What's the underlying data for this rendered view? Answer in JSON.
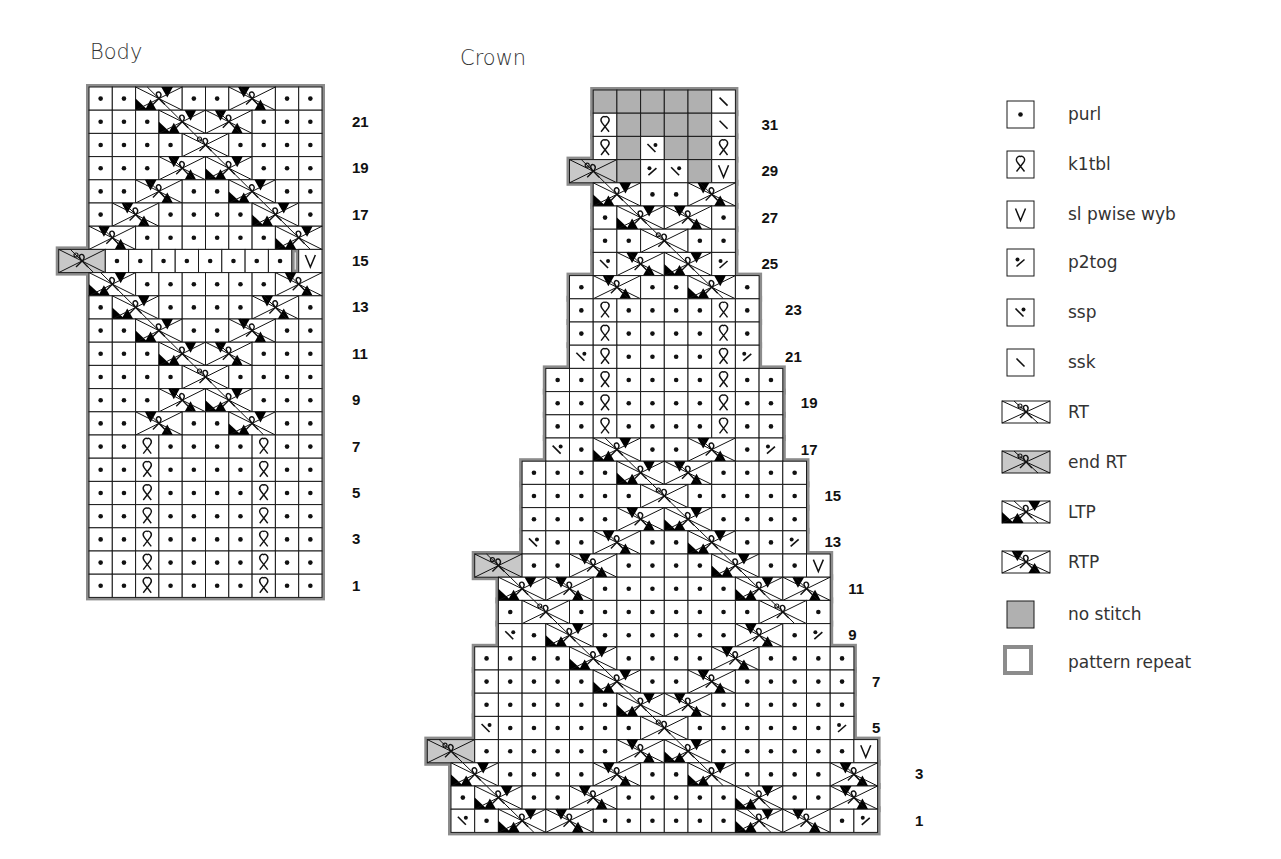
{
  "titles": {
    "body": "Body",
    "crown": "Crown"
  },
  "legend": [
    {
      "code": "p",
      "label": "purl"
    },
    {
      "code": "k",
      "label": "k1tbl"
    },
    {
      "code": "v",
      "label": "sl pwise wyb"
    },
    {
      "code": "p2",
      "label": "p2tog"
    },
    {
      "code": "ss",
      "label": "ssp"
    },
    {
      "code": "sk",
      "label": "ssk"
    },
    {
      "code": "RT",
      "label": "RT"
    },
    {
      "code": "ERT",
      "label": "end RT"
    },
    {
      "code": "LTP",
      "label": "LTP"
    },
    {
      "code": "RTP",
      "label": "RTP"
    },
    {
      "code": "ns",
      "label": "no stitch"
    },
    {
      "code": "rep",
      "label": "pattern repeat"
    }
  ],
  "colors": {
    "grid": "#1a1a1a",
    "repeat_border": "#8c8c8c",
    "no_stitch": "#b0b0b0",
    "end_rt": "#c8c8c8",
    "fill": "#000000"
  },
  "chart_data": [
    {
      "type": "table",
      "title": "Body",
      "columns": 10,
      "row_labels": [
        1,
        3,
        5,
        7,
        9,
        11,
        13,
        15,
        17,
        19,
        21
      ],
      "rows": [
        {
          "row": 22,
          "off": 0,
          "cells": [
            "p",
            "p",
            "LTP",
            "_",
            "p",
            "p",
            "RTP",
            "_",
            "p",
            "p"
          ]
        },
        {
          "row": 21,
          "off": 0,
          "cells": [
            "p",
            "p",
            "p",
            "LTP",
            "_",
            "RTP",
            "_",
            "p",
            "p",
            "p"
          ]
        },
        {
          "row": 20,
          "off": 0,
          "cells": [
            "p",
            "p",
            "p",
            "p",
            "RT",
            "_",
            "p",
            "p",
            "p",
            "p"
          ]
        },
        {
          "row": 19,
          "off": 0,
          "cells": [
            "p",
            "p",
            "p",
            "RTP",
            "_",
            "LTP",
            "_",
            "p",
            "p",
            "p"
          ]
        },
        {
          "row": 18,
          "off": 0,
          "cells": [
            "p",
            "p",
            "RTP",
            "_",
            "p",
            "p",
            "LTP",
            "_",
            "p",
            "p"
          ]
        },
        {
          "row": 17,
          "off": 0,
          "cells": [
            "p",
            "RTP",
            "_",
            "p",
            "p",
            "p",
            "p",
            "LTP",
            "_",
            "p"
          ]
        },
        {
          "row": 16,
          "off": 0,
          "cells": [
            "RTP",
            "_",
            "p",
            "p",
            "p",
            "p",
            "p",
            "p",
            "LTP",
            "_"
          ]
        },
        {
          "row": 15,
          "off": -1.3,
          "cells": [
            "ERT",
            "_",
            "p",
            "p",
            "p",
            "p",
            "p",
            "p",
            "p",
            "p"
          ],
          "extra": [
            {
              "col": 9,
              "code": "v"
            }
          ]
        },
        {
          "row": 14,
          "off": 0,
          "cells": [
            "LTP",
            "_",
            "p",
            "p",
            "p",
            "p",
            "p",
            "p",
            "RTP",
            "_"
          ]
        },
        {
          "row": 13,
          "off": 0,
          "cells": [
            "p",
            "LTP",
            "_",
            "p",
            "p",
            "p",
            "p",
            "RTP",
            "_",
            "p"
          ]
        },
        {
          "row": 12,
          "off": 0,
          "cells": [
            "p",
            "p",
            "LTP",
            "_",
            "p",
            "p",
            "RTP",
            "_",
            "p",
            "p"
          ]
        },
        {
          "row": 11,
          "off": 0,
          "cells": [
            "p",
            "p",
            "p",
            "LTP",
            "_",
            "RTP",
            "_",
            "p",
            "p",
            "p"
          ]
        },
        {
          "row": 10,
          "off": 0,
          "cells": [
            "p",
            "p",
            "p",
            "p",
            "RT",
            "_",
            "p",
            "p",
            "p",
            "p"
          ]
        },
        {
          "row": 9,
          "off": 0,
          "cells": [
            "p",
            "p",
            "p",
            "RTP",
            "_",
            "LTP",
            "_",
            "p",
            "p",
            "p"
          ]
        },
        {
          "row": 8,
          "off": 0,
          "cells": [
            "p",
            "p",
            "RTP",
            "_",
            "p",
            "p",
            "LTP",
            "_",
            "p",
            "p"
          ]
        },
        {
          "row": 7,
          "off": 0,
          "cells": [
            "p",
            "p",
            "k",
            "p",
            "p",
            "p",
            "p",
            "k",
            "p",
            "p"
          ]
        },
        {
          "row": 6,
          "off": 0,
          "cells": [
            "p",
            "p",
            "k",
            "p",
            "p",
            "p",
            "p",
            "k",
            "p",
            "p"
          ]
        },
        {
          "row": 5,
          "off": 0,
          "cells": [
            "p",
            "p",
            "k",
            "p",
            "p",
            "p",
            "p",
            "k",
            "p",
            "p"
          ]
        },
        {
          "row": 4,
          "off": 0,
          "cells": [
            "p",
            "p",
            "k",
            "p",
            "p",
            "p",
            "p",
            "k",
            "p",
            "p"
          ]
        },
        {
          "row": 3,
          "off": 0,
          "cells": [
            "p",
            "p",
            "k",
            "p",
            "p",
            "p",
            "p",
            "k",
            "p",
            "p"
          ]
        },
        {
          "row": 2,
          "off": 0,
          "cells": [
            "p",
            "p",
            "k",
            "p",
            "p",
            "p",
            "p",
            "k",
            "p",
            "p"
          ]
        },
        {
          "row": 1,
          "off": 0,
          "cells": [
            "p",
            "p",
            "k",
            "p",
            "p",
            "p",
            "p",
            "k",
            "p",
            "p"
          ]
        }
      ]
    },
    {
      "type": "table",
      "title": "Crown",
      "columns": 18,
      "row_labels": [
        1,
        3,
        5,
        7,
        9,
        11,
        13,
        15,
        17,
        19,
        21,
        23,
        25,
        27,
        29,
        31
      ],
      "rows": [
        {
          "row": 32,
          "off": 6,
          "cells": [
            "ns",
            "ns",
            "ns",
            "ns",
            "ns",
            "sk"
          ]
        },
        {
          "row": 31,
          "off": 6,
          "cells": [
            "k",
            "ns",
            "ns",
            "ns",
            "ns",
            "sk"
          ]
        },
        {
          "row": 30,
          "off": 6,
          "cells": [
            "k",
            "ns",
            "ss",
            "ns",
            "ns",
            "k"
          ]
        },
        {
          "row": 29,
          "off": 5,
          "cells": [
            "ERT",
            "_",
            "ns",
            "p2",
            "ss",
            "ns",
            "v"
          ]
        },
        {
          "row": 28,
          "off": 6,
          "cells": [
            "LTP",
            "_",
            "p",
            "p",
            "RTP",
            "_"
          ]
        },
        {
          "row": 27,
          "off": 6,
          "cells": [
            "p",
            "LTP",
            "_",
            "RTP",
            "_",
            "p"
          ]
        },
        {
          "row": 26,
          "off": 6,
          "cells": [
            "p",
            "p",
            "RT",
            "_",
            "p",
            "p"
          ]
        },
        {
          "row": 25,
          "off": 6,
          "cells": [
            "ss",
            "RTP",
            "_",
            "LTP",
            "_",
            "p2"
          ]
        },
        {
          "row": 24,
          "off": 5,
          "cells": [
            "p",
            "RTP",
            "_",
            "p",
            "p",
            "LTP",
            "_",
            "p"
          ]
        },
        {
          "row": 23,
          "off": 5,
          "cells": [
            "p",
            "k",
            "p",
            "p",
            "p",
            "p",
            "k",
            "p"
          ]
        },
        {
          "row": 22,
          "off": 5,
          "cells": [
            "p",
            "k",
            "p",
            "p",
            "p",
            "p",
            "k",
            "p"
          ]
        },
        {
          "row": 21,
          "off": 5,
          "cells": [
            "ss",
            "k",
            "p",
            "p",
            "p",
            "p",
            "k",
            "p2"
          ]
        },
        {
          "row": 20,
          "off": 4,
          "cells": [
            "p",
            "p",
            "k",
            "p",
            "p",
            "p",
            "p",
            "k",
            "p",
            "p"
          ]
        },
        {
          "row": 19,
          "off": 4,
          "cells": [
            "p",
            "p",
            "k",
            "p",
            "p",
            "p",
            "p",
            "k",
            "p",
            "p"
          ]
        },
        {
          "row": 18,
          "off": 4,
          "cells": [
            "p",
            "p",
            "k",
            "p",
            "p",
            "p",
            "p",
            "k",
            "p",
            "p"
          ]
        },
        {
          "row": 17,
          "off": 4,
          "cells": [
            "ss",
            "p",
            "LTP",
            "_",
            "p",
            "p",
            "RTP",
            "_",
            "p",
            "p2"
          ]
        },
        {
          "row": 16,
          "off": 3,
          "cells": [
            "p",
            "p",
            "p",
            "p",
            "LTP",
            "_",
            "RTP",
            "_",
            "p",
            "p",
            "p",
            "p"
          ]
        },
        {
          "row": 15,
          "off": 3,
          "cells": [
            "p",
            "p",
            "p",
            "p",
            "p",
            "RT",
            "_",
            "p",
            "p",
            "p",
            "p",
            "p"
          ]
        },
        {
          "row": 14,
          "off": 3,
          "cells": [
            "p",
            "p",
            "p",
            "p",
            "RTP",
            "_",
            "LTP",
            "_",
            "p",
            "p",
            "p",
            "p"
          ]
        },
        {
          "row": 13,
          "off": 3,
          "cells": [
            "ss",
            "p",
            "p",
            "RTP",
            "_",
            "p",
            "p",
            "LTP",
            "_",
            "p",
            "p",
            "p2"
          ]
        },
        {
          "row": 12,
          "off": 1,
          "cells": [
            "ERT",
            "_",
            "p",
            "p",
            "RTP",
            "_",
            "p",
            "p",
            "p",
            "p",
            "LTP",
            "_",
            "p",
            "p",
            "v"
          ]
        },
        {
          "row": 11,
          "off": 2,
          "cells": [
            "LTP",
            "_",
            "RTP",
            "_",
            "p",
            "p",
            "p",
            "p",
            "p",
            "p",
            "LTP",
            "_",
            "RTP",
            "_"
          ]
        },
        {
          "row": 10,
          "off": 2,
          "cells": [
            "p",
            "RT",
            "_",
            "p",
            "p",
            "p",
            "p",
            "p",
            "p",
            "p",
            "p",
            "RT",
            "_",
            "p"
          ]
        },
        {
          "row": 9,
          "off": 2,
          "cells": [
            "ss",
            "p",
            "LTP",
            "_",
            "p",
            "p",
            "p",
            "p",
            "p",
            "p",
            "RTP",
            "_",
            "p",
            "p2"
          ]
        },
        {
          "row": 8,
          "off": 1,
          "cells": [
            "p",
            "p",
            "p",
            "p",
            "LTP",
            "_",
            "p",
            "p",
            "p",
            "p",
            "RTP",
            "_",
            "p",
            "p",
            "p",
            "p"
          ]
        },
        {
          "row": 7,
          "off": 1,
          "cells": [
            "p",
            "p",
            "p",
            "p",
            "p",
            "LTP",
            "_",
            "p",
            "p",
            "RTP",
            "_",
            "p",
            "p",
            "p",
            "p",
            "p"
          ]
        },
        {
          "row": 6,
          "off": 1,
          "cells": [
            "p",
            "p",
            "p",
            "p",
            "p",
            "p",
            "LTP",
            "_",
            "RTP",
            "_",
            "p",
            "p",
            "p",
            "p",
            "p",
            "p"
          ]
        },
        {
          "row": 5,
          "off": 1,
          "cells": [
            "ss",
            "p",
            "p",
            "p",
            "p",
            "p",
            "p",
            "RT",
            "_",
            "p",
            "p",
            "p",
            "p",
            "p",
            "p",
            "p2"
          ]
        },
        {
          "row": 4,
          "off": -1,
          "cells": [
            "ERT",
            "_",
            "p",
            "p",
            "p",
            "p",
            "p",
            "p",
            "RTP",
            "_",
            "LTP",
            "_",
            "p",
            "p",
            "p",
            "p",
            "p",
            "p",
            "v"
          ]
        },
        {
          "row": 3,
          "off": 0,
          "cells": [
            "LTP",
            "_",
            "p",
            "p",
            "p",
            "p",
            "RTP",
            "_",
            "p",
            "p",
            "LTP",
            "_",
            "p",
            "p",
            "p",
            "p",
            "RTP",
            "_"
          ]
        },
        {
          "row": 2,
          "off": 0,
          "cells": [
            "p",
            "LTP",
            "_",
            "p",
            "p",
            "RTP",
            "_",
            "p",
            "p",
            "p",
            "p",
            "p",
            "LTP",
            "_",
            "p",
            "p",
            "RTP",
            "_"
          ]
        },
        {
          "row": 1,
          "off": 0,
          "cells": [
            "ss",
            "p",
            "LTP",
            "_",
            "RTP",
            "_",
            "p",
            "p",
            "p",
            "p",
            "p",
            "p",
            "LTP",
            "_",
            "RTP",
            "_",
            "p",
            "p2"
          ]
        }
      ]
    }
  ]
}
